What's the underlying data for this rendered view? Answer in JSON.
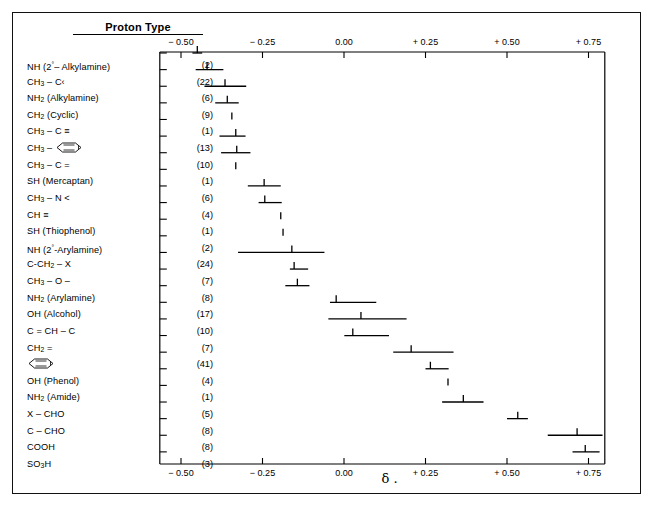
{
  "header": {
    "title": "Proton Type"
  },
  "axis": {
    "tick_labels": [
      "− 0.50",
      "− 0.25",
      "0.00",
      "+ 0.25",
      "+ 0.50",
      "+ 0.75"
    ],
    "tick_values": [
      -0.5,
      -0.25,
      0.0,
      0.25,
      0.5,
      0.75
    ],
    "symbol": "δ ."
  },
  "chart_data": {
    "type": "bar",
    "title": "Proton Type",
    "xlabel": "δ .",
    "ylabel": "Proton Type",
    "xlim": [
      -0.6,
      0.8
    ],
    "xticks": [
      -0.5,
      -0.25,
      0.0,
      0.25,
      0.5,
      0.75
    ],
    "xticklabels": [
      "− 0.50",
      "− 0.25",
      "0.00",
      "+ 0.25",
      "+ 0.50",
      "+ 0.75"
    ],
    "grid": false,
    "legend": null,
    "orientation": "horizontal-range",
    "note": "Each row shows a horizontal range bar (min..max) with a vertical tick at the mean value. Counts in parentheses give the number of compounds.",
    "categories": [
      "NH (2°– Alkylamine)",
      "CH3 – C‹",
      "NH2 (Alkylamine)",
      "CH2 (Cyclic)",
      "CH3 – C ≡",
      "CH3 – (phenyl)",
      "CH3 – C =",
      "SH (Mercaptan)",
      "CH3 – N <",
      "CH ≡",
      "SH (Thiophenol)",
      "NH (2°-Arylamine)",
      "C-CH2 – X",
      "CH3 – O –",
      "NH2 (Arylamine)",
      "OH (Alcohol)",
      "C = CH – C",
      "CH2 =",
      "(phenyl)",
      "OH (Phenol)",
      "NH2 (Amide)",
      "X – CHO",
      "C – CHO",
      "COOH",
      "SO3H"
    ],
    "counts": [
      2,
      22,
      6,
      9,
      1,
      13,
      10,
      1,
      6,
      4,
      1,
      2,
      24,
      7,
      8,
      17,
      10,
      7,
      41,
      4,
      1,
      5,
      8,
      8,
      3
    ],
    "ranges": [
      [
        -0.465,
        -0.435
      ],
      [
        -0.455,
        -0.37
      ],
      [
        -0.428,
        -0.3
      ],
      [
        -0.395,
        -0.323
      ],
      [
        null,
        null
      ],
      [
        -0.382,
        -0.302
      ],
      [
        -0.377,
        -0.287
      ],
      [
        null,
        null
      ],
      [
        -0.295,
        -0.194
      ],
      [
        -0.262,
        -0.191
      ],
      [
        null,
        null
      ],
      [
        null,
        null
      ],
      [
        -0.325,
        -0.06
      ],
      [
        -0.166,
        -0.11
      ],
      [
        -0.18,
        -0.106
      ],
      [
        -0.043,
        0.099
      ],
      [
        -0.048,
        0.192
      ],
      [
        0.001,
        0.138
      ],
      [
        0.151,
        0.336
      ],
      [
        0.25,
        0.321
      ],
      [
        null,
        null
      ],
      [
        0.301,
        0.428
      ],
      [
        0.5,
        0.564
      ],
      [
        0.625,
        0.793
      ],
      [
        0.701,
        0.784
      ]
    ],
    "values": [
      -0.45,
      -0.42,
      -0.365,
      -0.358,
      -0.344,
      -0.332,
      -0.329,
      -0.332,
      -0.245,
      -0.243,
      -0.194,
      -0.187,
      -0.16,
      -0.153,
      -0.143,
      -0.024,
      0.052,
      0.027,
      0.206,
      0.265,
      0.319,
      0.366,
      0.533,
      0.715,
      0.74
    ]
  },
  "rows": [
    {
      "label_html": "NH (2<sup>°</sup>– Alkylamine)",
      "count": "(2)"
    },
    {
      "label_html": "CH<sub>3</sub> – C‹",
      "count": "(22)"
    },
    {
      "label_html": "NH<sub>2</sub> (Alkylamine)",
      "count": "(6)"
    },
    {
      "label_html": "CH<sub>2</sub> (Cyclic)",
      "count": "(9)"
    },
    {
      "label_html": "CH<sub>3</sub> – C <span class='tbond'>≡</span>",
      "count": "(1)"
    },
    {
      "label_html": "CH<sub>3</sub> – @RING@",
      "count": "(13)"
    },
    {
      "label_html": "CH<sub>3</sub> – C =",
      "count": "(10)"
    },
    {
      "label_html": "SH (Mercaptan)",
      "count": "(1)"
    },
    {
      "label_html": "CH<sub>3</sub> – N <",
      "count": "(6)"
    },
    {
      "label_html": "CH <span class='tbond'>≡</span>",
      "count": "(4)"
    },
    {
      "label_html": "SH (Thiophenol)",
      "count": "(1)"
    },
    {
      "label_html": "NH (2<sup>°</sup>-Arylamine)",
      "count": "(2)"
    },
    {
      "label_html": "C-CH<sub>2</sub> – X",
      "count": "(24)"
    },
    {
      "label_html": "CH<sub>3</sub> – O –",
      "count": "(7)"
    },
    {
      "label_html": "NH<sub>2</sub> (Arylamine)",
      "count": "(8)"
    },
    {
      "label_html": "OH (Alcohol)",
      "count": "(17)"
    },
    {
      "label_html": "C = CH – C",
      "count": "(10)"
    },
    {
      "label_html": "CH<sub>2</sub> =",
      "count": "(7)"
    },
    {
      "label_html": "@RING@",
      "count": "(41)"
    },
    {
      "label_html": "OH (Phenol)",
      "count": "(4)"
    },
    {
      "label_html": "NH<sub>2</sub> (Amide)",
      "count": "(1)"
    },
    {
      "label_html": "X – CHO",
      "count": "(5)"
    },
    {
      "label_html": "C – CHO",
      "count": "(8)"
    },
    {
      "label_html": "COOH",
      "count": "(8)"
    },
    {
      "label_html": "SO<sub>3</sub>H",
      "count": "(3)"
    }
  ]
}
